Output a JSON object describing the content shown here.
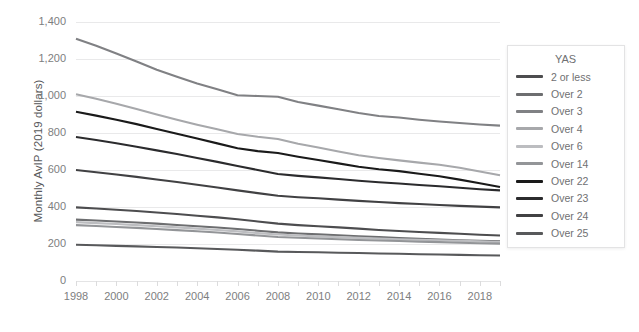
{
  "chart_data": {
    "type": "line",
    "title": "",
    "xlabel": "",
    "ylabel": "Monthly AvIP (2019 dollars)",
    "ylim": [
      0,
      1400
    ],
    "xlim": [
      1998,
      2019
    ],
    "grid": true,
    "legend_position": "right",
    "legend_title": "YAS",
    "y_ticks": [
      "0",
      "200",
      "400",
      "600",
      "800",
      "1,000",
      "1,200",
      "1,400"
    ],
    "y_tick_values": [
      0,
      200,
      400,
      600,
      800,
      1000,
      1200,
      1400
    ],
    "x_ticks": [
      "1998",
      "2000",
      "2002",
      "2004",
      "2006",
      "2008",
      "2010",
      "2012",
      "2014",
      "2016",
      "2018"
    ],
    "x_tick_values": [
      1998,
      2000,
      2002,
      2004,
      2006,
      2008,
      2010,
      2012,
      2014,
      2016,
      2018
    ],
    "x": [
      1998,
      1999,
      2000,
      2001,
      2002,
      2003,
      2004,
      2005,
      2006,
      2007,
      2008,
      2009,
      2010,
      2011,
      2012,
      2013,
      2014,
      2015,
      2016,
      2017,
      2018,
      2019
    ],
    "series": [
      {
        "name": "2 or less",
        "color": "#4d4d4f",
        "values": [
          398,
          392,
          385,
          378,
          370,
          362,
          353,
          344,
          334,
          322,
          310,
          302,
          296,
          290,
          283,
          276,
          270,
          265,
          260,
          255,
          250,
          246
        ]
      },
      {
        "name": "Over 2",
        "color": "#6d6e70",
        "values": [
          332,
          327,
          322,
          316,
          310,
          303,
          296,
          289,
          281,
          272,
          263,
          257,
          252,
          247,
          242,
          237,
          232,
          228,
          224,
          220,
          217,
          214
        ]
      },
      {
        "name": "Over 3",
        "color": "#808184",
        "values": [
          1310,
          1272,
          1230,
          1186,
          1142,
          1104,
          1068,
          1036,
          1004,
          1000,
          996,
          968,
          948,
          928,
          908,
          892,
          884,
          872,
          862,
          854,
          846,
          840
        ]
      },
      {
        "name": "Over 4",
        "color": "#a7a8ab",
        "values": [
          1010,
          985,
          958,
          930,
          900,
          872,
          845,
          820,
          795,
          780,
          768,
          742,
          722,
          700,
          680,
          665,
          652,
          640,
          628,
          612,
          592,
          572
        ]
      },
      {
        "name": "Over 6",
        "color": "#bcbdc0",
        "values": [
          318,
          313,
          308,
          302,
          296,
          290,
          283,
          276,
          268,
          259,
          251,
          246,
          241,
          237,
          233,
          229,
          226,
          223,
          220,
          217,
          214,
          211
        ]
      },
      {
        "name": "Over 14",
        "color": "#939598",
        "values": [
          302,
          297,
          292,
          287,
          281,
          275,
          269,
          262,
          254,
          246,
          238,
          234,
          230,
          226,
          222,
          219,
          216,
          213,
          210,
          207,
          204,
          202
        ]
      },
      {
        "name": "Over 22",
        "color": "#1a1a1a",
        "values": [
          915,
          894,
          872,
          848,
          822,
          796,
          770,
          744,
          718,
          702,
          692,
          672,
          654,
          636,
          618,
          604,
          594,
          580,
          566,
          548,
          528,
          508
        ]
      },
      {
        "name": "Over 23",
        "color": "#2b2b2d",
        "values": [
          778,
          762,
          745,
          726,
          706,
          686,
          665,
          644,
          622,
          600,
          578,
          568,
          560,
          551,
          542,
          534,
          527,
          519,
          512,
          504,
          496,
          490
        ]
      },
      {
        "name": "Over 24",
        "color": "#414143",
        "values": [
          600,
          588,
          576,
          563,
          549,
          535,
          520,
          505,
          490,
          475,
          461,
          453,
          447,
          440,
          433,
          427,
          421,
          416,
          411,
          406,
          402,
          398
        ]
      },
      {
        "name": "Over 25",
        "color": "#58595b",
        "values": [
          196,
          193,
          190,
          187,
          184,
          181,
          177,
          173,
          169,
          164,
          159,
          157,
          155,
          153,
          151,
          149,
          147,
          145,
          143,
          141,
          139,
          138
        ]
      }
    ]
  },
  "axis": {
    "y_title": "Monthly AvIP (2019 dollars)",
    "zero_label": "0"
  },
  "legend": {
    "title": "YAS",
    "items": [
      {
        "label": "2 or less",
        "color": "#4d4d4f"
      },
      {
        "label": "Over 2",
        "color": "#6d6e70"
      },
      {
        "label": "Over 3",
        "color": "#808184"
      },
      {
        "label": "Over 4",
        "color": "#a7a8ab"
      },
      {
        "label": "Over 6",
        "color": "#bcbdc0"
      },
      {
        "label": "Over 14",
        "color": "#939598"
      },
      {
        "label": "Over 22",
        "color": "#1a1a1a"
      },
      {
        "label": "Over 23",
        "color": "#2b2b2d"
      },
      {
        "label": "Over 24",
        "color": "#414143"
      },
      {
        "label": "Over 25",
        "color": "#58595b"
      }
    ]
  },
  "colors": {
    "grid": "#e9e9ea",
    "axis_text": "#7d7e80",
    "title_text": "#58595b",
    "background": "#ffffff",
    "legend_border": "#e3e3e4"
  }
}
